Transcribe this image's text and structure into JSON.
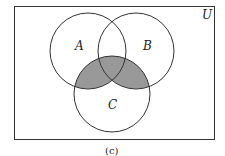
{
  "diagram": {
    "type": "venn",
    "universe_label": "U",
    "sets": [
      {
        "name": "A",
        "label": "A"
      },
      {
        "name": "B",
        "label": "B"
      },
      {
        "name": "C",
        "label": "C"
      }
    ],
    "shaded_region": "(A ∪ B) ∩ C",
    "caption": "(c)",
    "colors": {
      "stroke": "#333333",
      "shading": "#8a8a8a",
      "background": "#ffffff"
    }
  }
}
